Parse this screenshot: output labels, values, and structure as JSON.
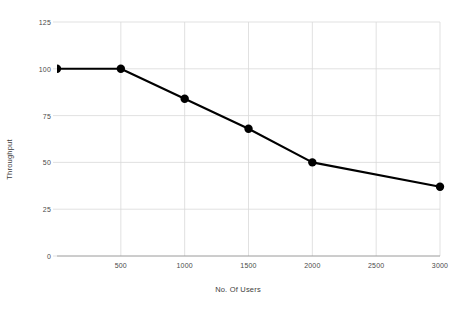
{
  "chart_data": {
    "type": "line",
    "title": "",
    "xlabel": "No. Of Users",
    "ylabel": "Throughput",
    "x": [
      0,
      500,
      1000,
      1500,
      2000,
      3000
    ],
    "values": [
      100,
      100,
      84,
      68,
      50,
      37
    ],
    "series": [
      {
        "name": "Throughput",
        "values": [
          100,
          100,
          84,
          68,
          50,
          37
        ]
      }
    ],
    "xlim": [
      0,
      3000
    ],
    "ylim": [
      0,
      125
    ],
    "xticks": [
      500,
      1000,
      1500,
      2000,
      2500,
      3000
    ],
    "yticks": [
      0,
      25,
      50,
      75,
      100,
      125
    ],
    "xtick_labels": [
      "500",
      "1000",
      "1500",
      "2000",
      "2500",
      "3000"
    ],
    "ytick_labels": [
      "0",
      "25",
      "50",
      "75",
      "100",
      "125"
    ],
    "grid": true,
    "legend": false,
    "line_color": "#000000",
    "marker_color": "#000000",
    "grid_color": "#d9d9d9",
    "axis_color": "#9a9a9a"
  },
  "axes": {
    "x_title": "No. Of Users",
    "y_title": "Throughput"
  }
}
